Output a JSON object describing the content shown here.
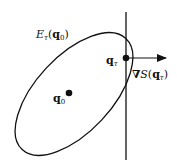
{
  "diagram": {
    "ellipse_label": {
      "main": "E",
      "sub": "τ",
      "arg_open": "(",
      "arg": "q",
      "arg_sub": "0",
      "arg_close": ")"
    },
    "center_label": {
      "main": "q",
      "sub": "0"
    },
    "tangent_point_label": {
      "main": "q",
      "sub": "τ"
    },
    "gradient_label": {
      "nabla": "∇",
      "func": "S",
      "arg_open": "(",
      "arg": "q",
      "arg_sub": "τ",
      "arg_close": ")"
    },
    "colors": {
      "stroke": "#111111",
      "background": "#ffffff"
    }
  }
}
